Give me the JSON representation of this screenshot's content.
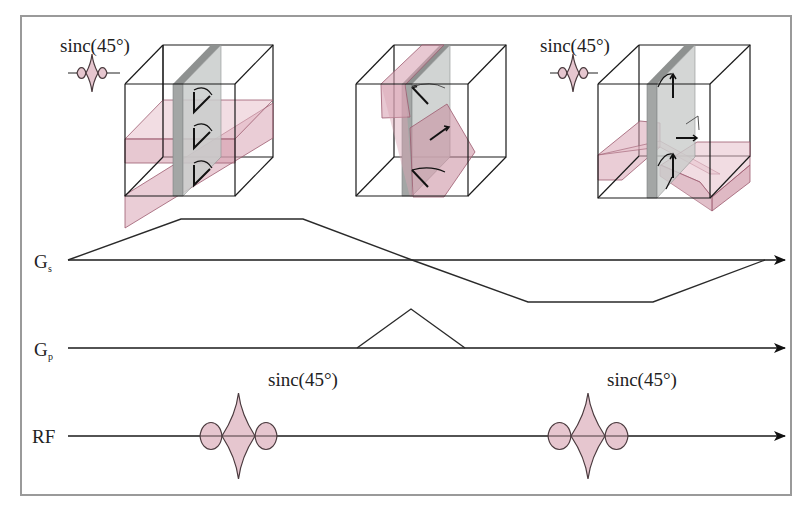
{
  "colors": {
    "frame": "#9a9a9a",
    "pink_fill": "#d9a4b4",
    "pink_edge": "#9c5a6e",
    "gray_slab": "#c9cccb",
    "gray_slab_edge": "#8e9190",
    "sinc_fill": "#e6c6cf",
    "sinc_edge": "#4a3a3e",
    "line": "#1a1a1a"
  },
  "top_labels": [
    {
      "id": "sinc-label-1",
      "text": "sinc(45°)",
      "x": 60,
      "y": 52
    },
    {
      "id": "sinc-label-2",
      "text": "sinc(45°)",
      "x": 540,
      "y": 52
    }
  ],
  "row_labels": {
    "gs": {
      "main": "G",
      "sub": "s"
    },
    "gp": {
      "main": "G",
      "sub": "p"
    },
    "rf": {
      "main": "RF"
    }
  },
  "rf_labels": [
    {
      "text": "sinc(45°)",
      "x": 268,
      "y": 386
    },
    {
      "text": "sinc(45°)",
      "x": 607,
      "y": 386
    }
  ],
  "cubes": [
    {
      "id": "cube-1",
      "front": [
        125,
        84,
        235,
        196
      ],
      "back_offset": [
        38,
        -39
      ],
      "description": "slice-select plane with 90-degree excitation"
    },
    {
      "id": "cube-2",
      "front": [
        356,
        84,
        468,
        196
      ],
      "back_offset": [
        38,
        -39
      ],
      "description": "phase-encode rotated plane"
    },
    {
      "id": "cube-3",
      "front": [
        598,
        84,
        710,
        198
      ],
      "back_offset": [
        40,
        -39
      ],
      "description": "refocusing plane"
    }
  ],
  "waveforms": {
    "gs": {
      "baseline_y": 260,
      "x_start": 68,
      "x_end": 785,
      "points": [
        [
          68,
          260
        ],
        [
          181,
          219
        ],
        [
          303,
          219
        ],
        [
          412,
          260
        ],
        [
          528,
          302
        ],
        [
          653,
          302
        ],
        [
          765,
          260
        ]
      ]
    },
    "gp": {
      "baseline_y": 348,
      "x_start": 68,
      "x_end": 785,
      "points": [
        [
          357,
          348
        ],
        [
          411,
          309
        ],
        [
          465,
          348
        ]
      ]
    },
    "rf": {
      "baseline_y": 436,
      "x_start": 68,
      "x_end": 785,
      "pulses": [
        {
          "left": 200,
          "l1": 222,
          "r1": 255,
          "right": 277,
          "main_h": 43,
          "side_h": 15
        },
        {
          "left": 548,
          "l1": 571,
          "r1": 605,
          "right": 628,
          "main_h": 43,
          "side_h": 15
        }
      ]
    }
  },
  "icons": [
    {
      "id": "sinc-icon-1",
      "cx": 92,
      "cy": 73,
      "line": [
        68,
        120
      ]
    },
    {
      "id": "sinc-icon-2",
      "cx": 573,
      "cy": 73,
      "line": [
        550,
        598
      ]
    }
  ]
}
